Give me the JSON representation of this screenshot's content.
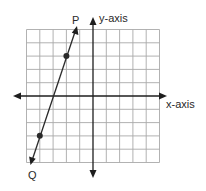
{
  "diagram": {
    "type": "coordinate-grid",
    "grid": {
      "x_min": -5,
      "x_max": 5,
      "y_min": -5,
      "y_max": 5,
      "step": 1,
      "color": "#a9a9a9"
    },
    "axes": {
      "x_label": "x-axis",
      "y_label": "y-axis",
      "color": "#1e1e1e"
    },
    "line": {
      "start_label": "P",
      "end_label": "Q",
      "points": [
        {
          "x": -2,
          "y": 3
        },
        {
          "x": -4,
          "y": -3
        }
      ],
      "slope": 3,
      "color": "#2a2a2a"
    }
  }
}
